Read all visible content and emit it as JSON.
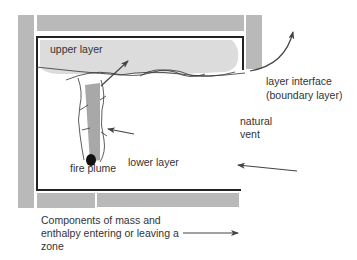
{
  "diagram": {
    "labels": {
      "upper_layer": "upper layer",
      "layer_interface_line1": "layer interface",
      "layer_interface_line2": "(boundary layer)",
      "natural_vent_line1": "natural",
      "natural_vent_line2": "vent",
      "fire_plume": "fire plume",
      "lower_layer": "lower layer"
    },
    "legend": {
      "line1": "Components of mass and",
      "line2": "enthalpy entering or leaving a",
      "line3": "zone",
      "symbol": "arrow-right"
    },
    "colors": {
      "wall": "#b9b9b9",
      "upper_layer_smoke": "#dcdcdc",
      "plume": "#a8a8a8",
      "outline": "#222222",
      "arrow": "#444444",
      "text": "#333333"
    }
  }
}
